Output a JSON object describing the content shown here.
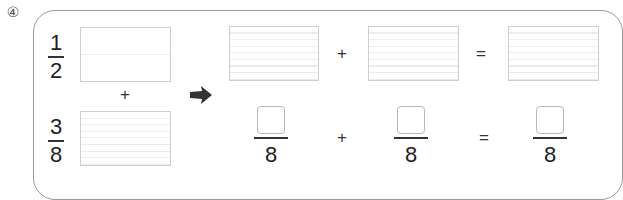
{
  "problem": {
    "number_label": "④"
  },
  "left": {
    "fraction_top": {
      "numerator": "1",
      "denominator": "2"
    },
    "operator": "+",
    "fraction_bottom": {
      "numerator": "3",
      "denominator": "8"
    }
  },
  "arrow_icon": "right-arrow",
  "right": {
    "top_row": {
      "operator_1": "+",
      "operator_2": "="
    },
    "bottom_row": {
      "fraction_1": {
        "numerator_blank": "",
        "denominator": "8"
      },
      "operator_1": "+",
      "fraction_2": {
        "numerator_blank": "",
        "denominator": "8"
      },
      "operator_2": "=",
      "fraction_3": {
        "numerator_blank": "",
        "denominator": "8"
      }
    }
  },
  "colors": {
    "border": "#9a9a9a",
    "box_border": "#cfcfcf",
    "grid_line": "#ececec",
    "text": "#222222"
  }
}
